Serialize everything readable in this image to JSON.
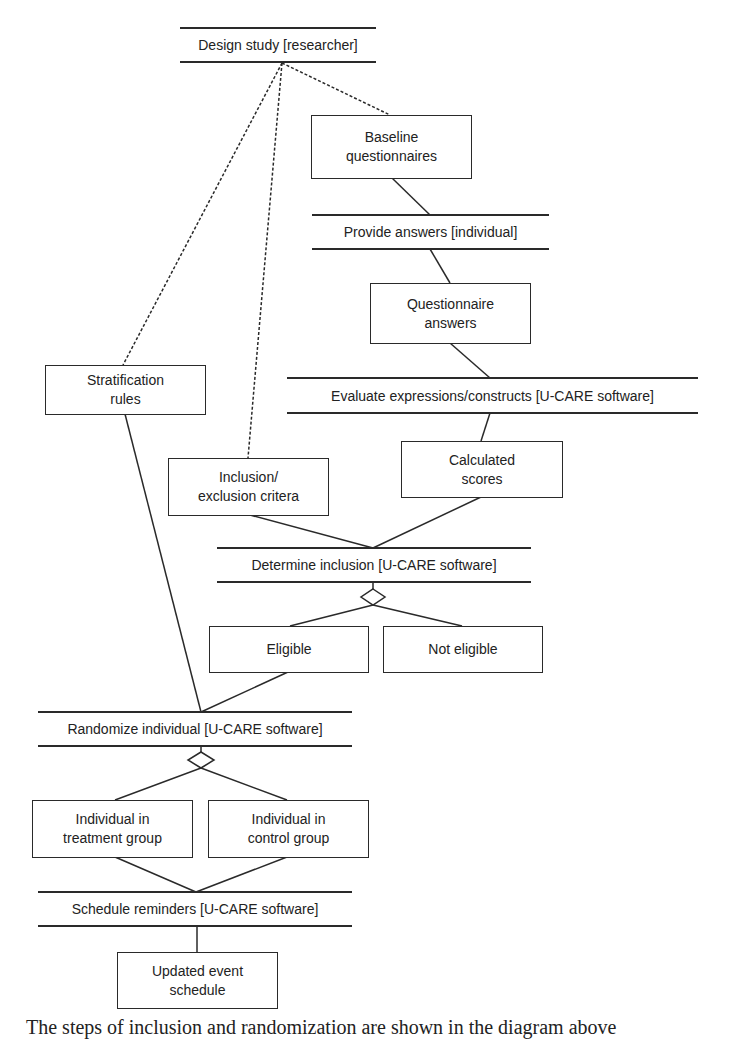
{
  "diagram": {
    "activities": {
      "design_study": "Design study [researcher]",
      "provide_answers": "Provide answers [individual]",
      "evaluate": "Evaluate expressions/constructs [U-CARE software]",
      "determine_inclusion": "Determine inclusion [U-CARE software]",
      "randomize": "Randomize individual [U-CARE software]",
      "schedule_reminders": "Schedule reminders [U-CARE software]"
    },
    "objects": {
      "baseline_line1": "Baseline",
      "baseline_line2": "questionnaires",
      "qanswers_line1": "Questionnaire",
      "qanswers_line2": "answers",
      "stratification_line1": "Stratification",
      "stratification_line2": "rules",
      "inclusion_line1": "Inclusion/",
      "inclusion_line2": "exclusion critera",
      "scores_line1": "Calculated",
      "scores_line2": "scores",
      "eligible": "Eligible",
      "not_eligible": "Not eligible",
      "treatment_line1": "Individual in",
      "treatment_line2": "treatment group",
      "control_line1": "Individual in",
      "control_line2": "control group",
      "schedule_line1": "Updated event",
      "schedule_line2": "schedule"
    },
    "caption": "The steps of inclusion and randomization are shown in the diagram above"
  }
}
